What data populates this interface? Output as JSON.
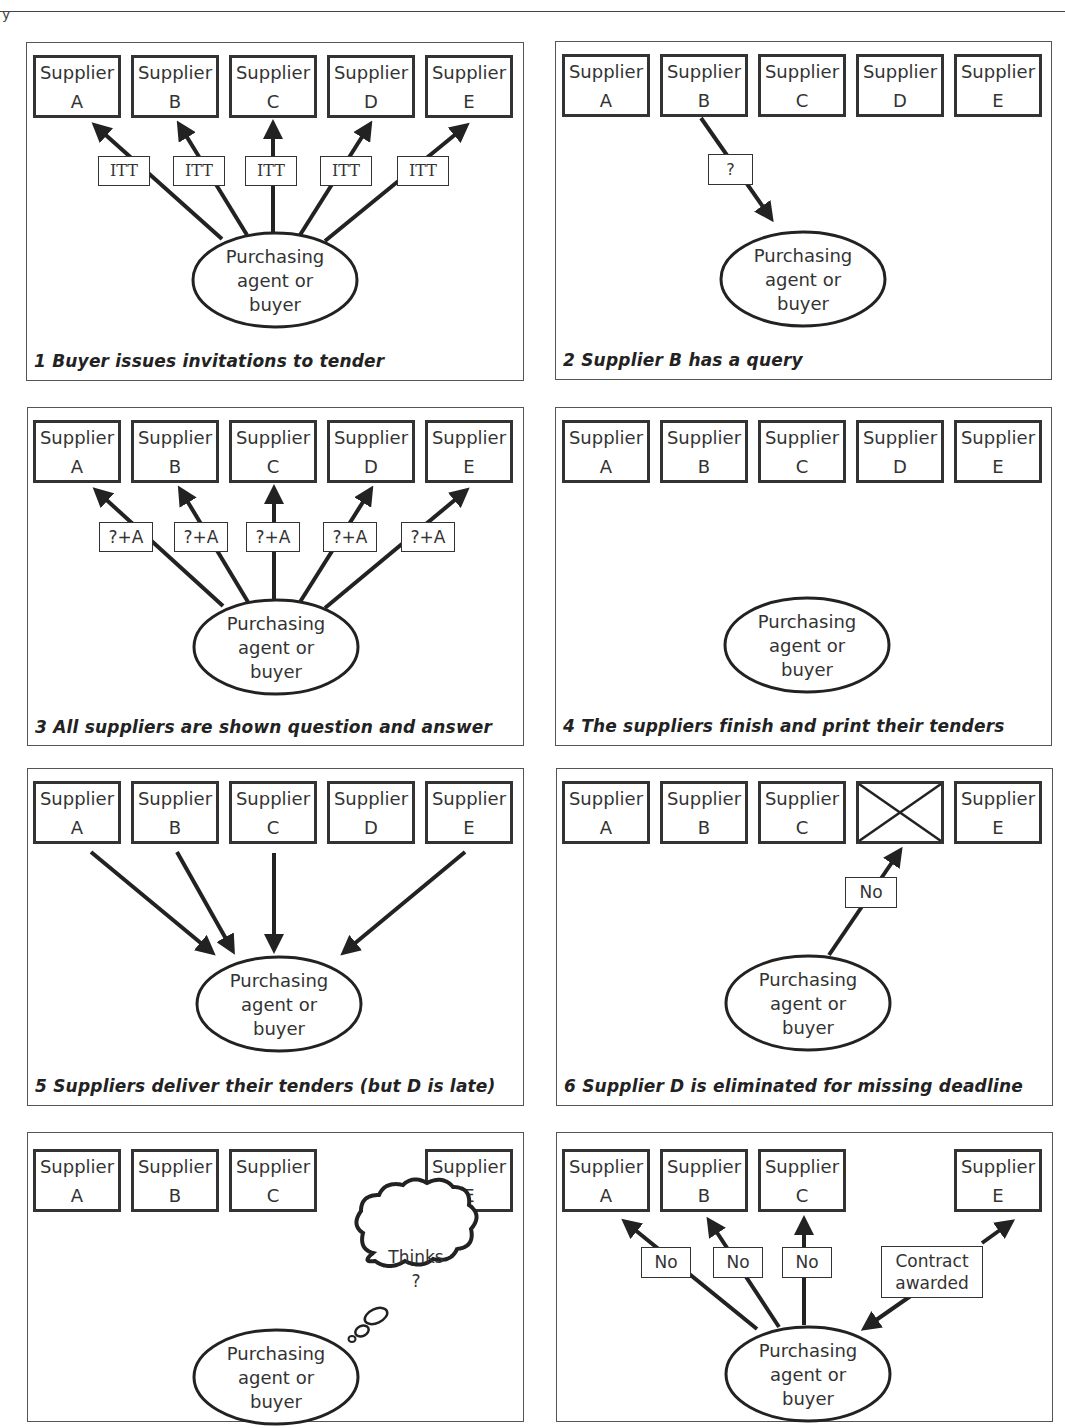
{
  "page": {
    "top_fragment": "y"
  },
  "common": {
    "supplier_word": "Supplier",
    "buyer_lines": [
      "Purchasing",
      "agent or",
      "buyer"
    ]
  },
  "panels": [
    {
      "id": 1,
      "caption": "1 Buyer issues invitations to tender",
      "suppliers": [
        "A",
        "B",
        "C",
        "D",
        "E"
      ],
      "message_labels": [
        "ITT",
        "ITT",
        "ITT",
        "ITT",
        "ITT"
      ],
      "arrows": "buyer-to-all-suppliers"
    },
    {
      "id": 2,
      "caption": "2 Supplier B has a query",
      "suppliers": [
        "A",
        "B",
        "C",
        "D",
        "E"
      ],
      "message_labels": [
        "?"
      ],
      "arrows": "supplier-B-to-buyer"
    },
    {
      "id": 3,
      "caption": "3 All suppliers are shown question and answer",
      "suppliers": [
        "A",
        "B",
        "C",
        "D",
        "E"
      ],
      "message_labels": [
        "?+A",
        "?+A",
        "?+A",
        "?+A",
        "?+A"
      ],
      "arrows": "buyer-to-all-suppliers"
    },
    {
      "id": 4,
      "caption": "4 The suppliers finish and print their tenders",
      "suppliers": [
        "A",
        "B",
        "C",
        "D",
        "E"
      ],
      "message_labels": [],
      "arrows": "none"
    },
    {
      "id": 5,
      "caption": "5 Suppliers deliver their tenders (but D is late)",
      "suppliers": [
        "A",
        "B",
        "C",
        "D",
        "E"
      ],
      "message_labels": [],
      "arrows": "suppliers-A-B-C-E-to-buyer"
    },
    {
      "id": 6,
      "caption": "6 Supplier D is eliminated for missing deadline",
      "suppliers": [
        "A",
        "B",
        "C",
        "X",
        "E"
      ],
      "message_labels": [
        "No"
      ],
      "arrows": "buyer-to-D"
    },
    {
      "id": 7,
      "caption": "",
      "suppliers": [
        "A",
        "B",
        "C",
        "",
        "E"
      ],
      "thought_bubble": [
        "Thinks",
        "?"
      ],
      "arrows": "none"
    },
    {
      "id": 8,
      "caption": "",
      "suppliers": [
        "A",
        "B",
        "C",
        "",
        "E"
      ],
      "message_labels": [
        "No",
        "No",
        "No",
        "Contract awarded"
      ],
      "contract_label_lines": [
        "Contract",
        "awarded"
      ],
      "arrows": "buyer-to-A-B-C-E"
    }
  ]
}
